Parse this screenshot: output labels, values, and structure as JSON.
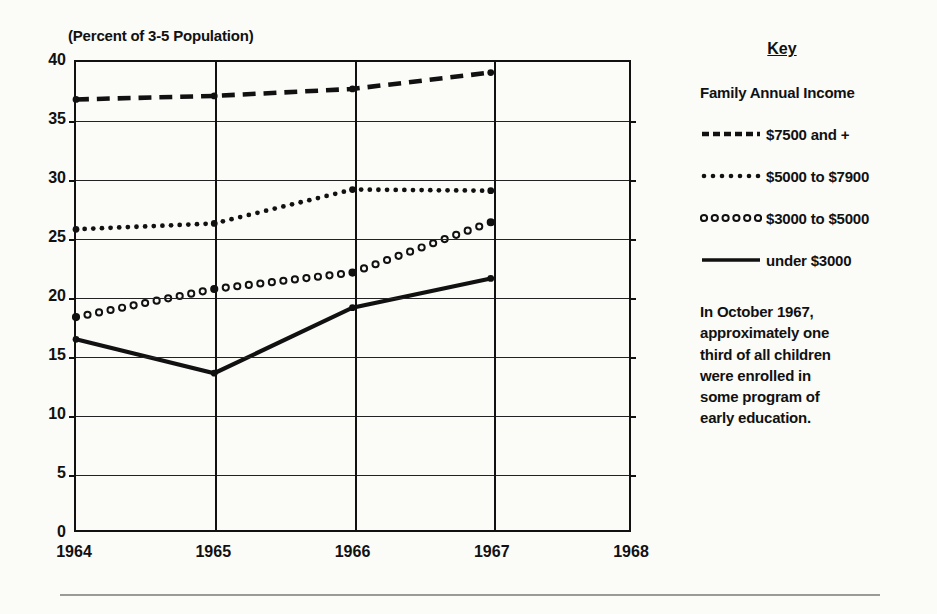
{
  "chart_data": {
    "type": "line",
    "title": "(Percent of 3-5 Population)",
    "xlabel": "",
    "ylabel": "",
    "xlim": [
      1964,
      1968
    ],
    "ylim": [
      0,
      40
    ],
    "ytick_step": 5,
    "grid": true,
    "legend_position": "right",
    "x": [
      1964,
      1965,
      1966,
      1967
    ],
    "xtick_labels": [
      "1964",
      "1965",
      "1966",
      "1967",
      "1968"
    ],
    "ytick_labels": [
      "0",
      "5",
      "10",
      "15",
      "20",
      "25",
      "30",
      "35",
      "40"
    ],
    "series": [
      {
        "name": "$7500 and +",
        "style": "dashed",
        "values": [
          36.8,
          37.1,
          37.7,
          39.1
        ]
      },
      {
        "name": "$5000 to $7900",
        "style": "dotted",
        "values": [
          25.7,
          26.2,
          29.1,
          29.0
        ]
      },
      {
        "name": "$3000 to $5000",
        "style": "open-circles",
        "values": [
          18.2,
          20.6,
          22.0,
          26.3
        ]
      },
      {
        "name": "under $3000",
        "style": "solid",
        "values": [
          16.3,
          13.4,
          19.0,
          21.5
        ]
      }
    ]
  },
  "legend": {
    "title": "Key",
    "subtitle": "Family Annual Income",
    "items": [
      {
        "label": "$7500 and  +",
        "swatch": "dashed-line-swatch"
      },
      {
        "label": "$5000 to $7900",
        "swatch": "dotted-line-swatch"
      },
      {
        "label": "$3000 to $5000",
        "swatch": "circle-line-swatch"
      },
      {
        "label": "under $3000",
        "swatch": "solid-line-swatch"
      }
    ],
    "note": "In October 1967, approximately one third of all children were enrolled in some program of early education."
  },
  "colors": {
    "ink": "#111111",
    "grid": "#222222",
    "background": "#fbfbf8",
    "rule": "#9a9a98"
  }
}
